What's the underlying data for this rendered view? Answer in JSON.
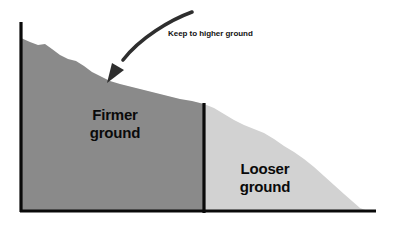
{
  "diagram": {
    "annotation": {
      "text": "Keep to higher ground"
    },
    "regions": [
      {
        "id": "firmer",
        "label": "Firmer\nground",
        "fill": "#8a8a8a"
      },
      {
        "id": "looser",
        "label": "Looser\nground",
        "fill": "#d2d2d2"
      }
    ],
    "axes": {
      "stroke": "#0a0a0a",
      "vertical": {
        "x": 21,
        "y1": 22,
        "y2": 212
      },
      "horizontal": {
        "y": 211,
        "x1": 21,
        "x2": 376
      },
      "divider": {
        "x": 204,
        "y1": 103,
        "y2": 213
      }
    },
    "arrow": {
      "stroke": "#2e2e2e",
      "path": "M 192 12 C 168 22 138 40 124 58",
      "head": {
        "tip_x": 107,
        "tip_y": 83
      }
    }
  },
  "chart_data": {
    "type": "area",
    "xlabel": "",
    "ylabel": "",
    "grid": false,
    "legend_position": "none",
    "annotations": [
      {
        "text": "Keep to higher ground",
        "x": 168,
        "y": 33
      },
      {
        "text": "Firmer ground",
        "x": 115,
        "y": 122
      },
      {
        "text": "Looser ground",
        "x": 265,
        "y": 176
      }
    ],
    "series": [
      {
        "name": "Firmer ground",
        "fill": "#8a8a8a",
        "profile": [
          [
            21,
            38
          ],
          [
            30,
            42
          ],
          [
            38,
            45
          ],
          [
            45,
            44
          ],
          [
            52,
            49
          ],
          [
            60,
            55
          ],
          [
            68,
            59
          ],
          [
            76,
            61
          ],
          [
            84,
            66
          ],
          [
            92,
            72
          ],
          [
            100,
            76
          ],
          [
            110,
            81
          ],
          [
            120,
            84
          ],
          [
            132,
            87
          ],
          [
            144,
            90
          ],
          [
            156,
            93
          ],
          [
            168,
            96
          ],
          [
            180,
            99
          ],
          [
            192,
            101
          ],
          [
            204,
            104
          ]
        ]
      },
      {
        "name": "Looser ground",
        "fill": "#d2d2d2",
        "profile": [
          [
            204,
            104
          ],
          [
            214,
            108
          ],
          [
            224,
            114
          ],
          [
            234,
            120
          ],
          [
            244,
            125
          ],
          [
            254,
            129
          ],
          [
            264,
            133
          ],
          [
            274,
            139
          ],
          [
            284,
            146
          ],
          [
            294,
            152
          ],
          [
            304,
            159
          ],
          [
            314,
            167
          ],
          [
            324,
            176
          ],
          [
            334,
            185
          ],
          [
            344,
            194
          ],
          [
            352,
            201
          ],
          [
            360,
            208
          ],
          [
            368,
            211
          ],
          [
            376,
            211
          ]
        ]
      }
    ],
    "baseline_y": 211
  }
}
